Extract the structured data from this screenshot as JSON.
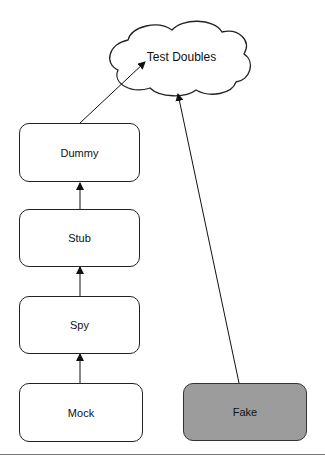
{
  "diagram": {
    "root": {
      "label": "Test Doubles",
      "shape": "cloud"
    },
    "nodes": [
      {
        "id": "dummy",
        "label": "Dummy",
        "fill": "#ffffff"
      },
      {
        "id": "stub",
        "label": "Stub",
        "fill": "#ffffff"
      },
      {
        "id": "spy",
        "label": "Spy",
        "fill": "#ffffff"
      },
      {
        "id": "mock",
        "label": "Mock",
        "fill": "#ffffff"
      },
      {
        "id": "fake",
        "label": "Fake",
        "fill": "#9c9c9c"
      }
    ],
    "edges": [
      {
        "from": "mock",
        "to": "spy"
      },
      {
        "from": "spy",
        "to": "stub"
      },
      {
        "from": "stub",
        "to": "dummy"
      },
      {
        "from": "dummy",
        "to": "root"
      },
      {
        "from": "fake",
        "to": "root"
      }
    ]
  }
}
